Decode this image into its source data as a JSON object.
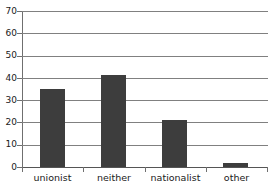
{
  "chart_data": {
    "type": "bar",
    "title": "",
    "subtitle": "",
    "xlabel": "",
    "ylabel": "",
    "categories": [
      "unionist",
      "neither",
      "nationalist",
      "other"
    ],
    "values": [
      35,
      41.5,
      21,
      2
    ],
    "series": [
      {
        "name": "",
        "values": [
          35,
          41.5,
          21,
          2
        ]
      }
    ],
    "ylim": [
      0,
      70
    ],
    "y_ticks": [
      0,
      10,
      20,
      30,
      40,
      50,
      60,
      70
    ],
    "y_tick_labels": [
      "0",
      "10",
      "20",
      "30",
      "40",
      "50",
      "60",
      "70"
    ],
    "grid": true,
    "grid_axis": "y",
    "legend": false,
    "legend_position": "none",
    "bar_color": "#3d3d3d",
    "grid_color": "#808080",
    "axis_color": "#6f6f6f",
    "text_color": "#1a1a1a",
    "background": "#ffffff"
  }
}
